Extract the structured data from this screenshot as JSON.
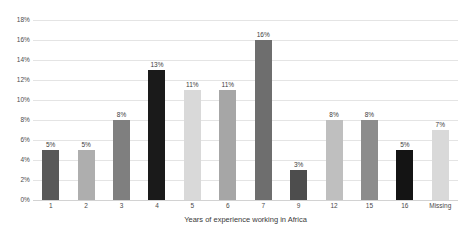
{
  "chart_data": {
    "type": "bar",
    "title": "",
    "xlabel": "Years of experience working in Africa",
    "ylabel": "",
    "categories": [
      "1",
      "2",
      "3",
      "4",
      "5",
      "6",
      "7",
      "9",
      "12",
      "15",
      "16",
      "Missing"
    ],
    "values": [
      5,
      5,
      8,
      13,
      11,
      11,
      16,
      3,
      8,
      8,
      5,
      7
    ],
    "data_labels": [
      "5%",
      "5%",
      "8%",
      "13%",
      "11%",
      "11%",
      "16%",
      "3%",
      "8%",
      "8%",
      "5%",
      "7%"
    ],
    "bar_colors": [
      "#595959",
      "#aeaeae",
      "#7f7f7f",
      "#1a1a1a",
      "#d9d9d9",
      "#a6a6a6",
      "#6e6e6e",
      "#4d4d4d",
      "#bfbfbf",
      "#8c8c8c",
      "#141414",
      "#d9d9d9"
    ],
    "ylim": [
      0,
      18
    ],
    "ytick_labels": [
      "0%",
      "2%",
      "4%",
      "6%",
      "8%",
      "10%",
      "12%",
      "14%",
      "16%",
      "18%"
    ],
    "ytick_values": [
      0,
      2,
      4,
      6,
      8,
      10,
      12,
      14,
      16,
      18
    ],
    "grid": true,
    "grid_color": "#e4e4e4",
    "legend": "none",
    "background": "#ffffff"
  }
}
